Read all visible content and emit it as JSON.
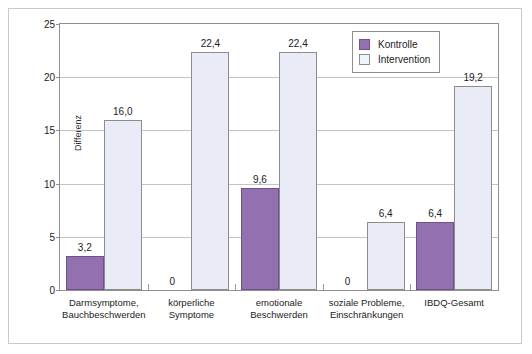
{
  "chart_data": {
    "type": "bar",
    "title": "",
    "xlabel": "",
    "ylabel": "Differenz",
    "ylim": [
      0,
      25
    ],
    "ytick_values": [
      0,
      5,
      10,
      15,
      20,
      25
    ],
    "ytick_labels": [
      "0",
      "5",
      "10",
      "15",
      "20",
      "25"
    ],
    "grid": "horizontal",
    "legend_position": "top-right",
    "categories": [
      "Darmsymptome,\nBauchbeschwerden",
      "körperliche\nSymptome",
      "emotionale\nBeschwerden",
      "soziale Probleme,\nEinschränkungen",
      "IBDQ-Gesamt"
    ],
    "category_lines": [
      [
        "Darmsymptome,",
        "Bauchbeschwerden"
      ],
      [
        "körperliche",
        "Symptome"
      ],
      [
        "emotionale",
        "Beschwerden"
      ],
      [
        "soziale Probleme,",
        "Einschränkungen"
      ],
      [
        "IBDQ-Gesamt",
        ""
      ]
    ],
    "series": [
      {
        "name": "Kontrolle",
        "color": "#9370b0",
        "values": [
          3.2,
          0,
          9.6,
          0,
          6.4
        ],
        "labels": [
          "3,2",
          "0",
          "9,6",
          "0",
          "6,4"
        ]
      },
      {
        "name": "Intervention",
        "color": "#e9ecf6",
        "values": [
          16.0,
          22.4,
          22.4,
          6.4,
          19.2
        ],
        "labels": [
          "16,0",
          "22,4",
          "22,4",
          "6,4",
          "19,2"
        ]
      }
    ]
  },
  "legend": {
    "entries": [
      {
        "label": "Kontrolle"
      },
      {
        "label": "Intervention"
      }
    ]
  }
}
